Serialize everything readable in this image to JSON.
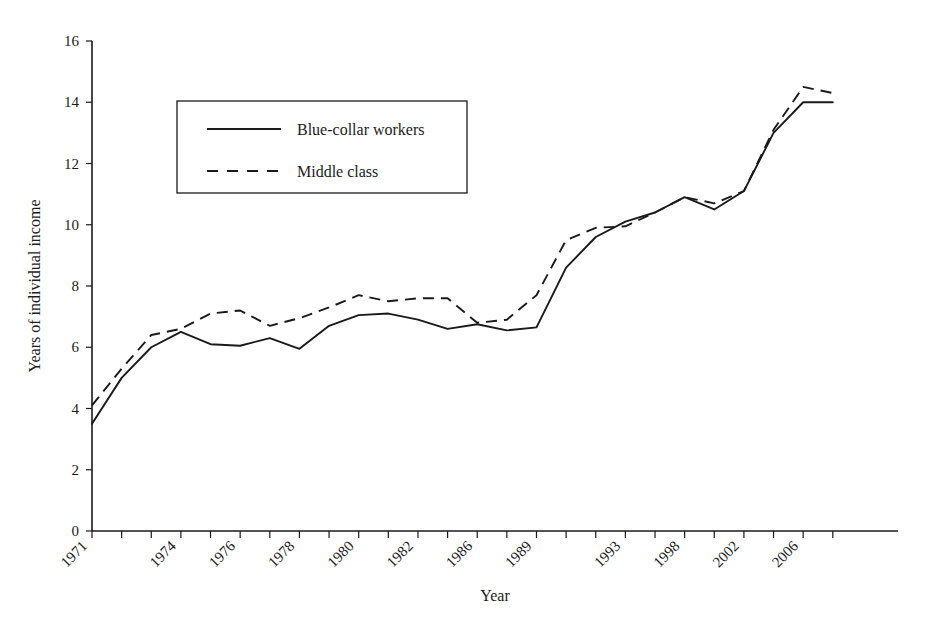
{
  "chart_data": {
    "type": "line",
    "title": "",
    "xlabel": "Year",
    "ylabel": "Years of individual income",
    "ylim": [
      0,
      16
    ],
    "ytick_values": [
      0,
      2,
      4,
      6,
      8,
      10,
      12,
      14,
      16
    ],
    "ytick_labels": [
      "0",
      "2",
      "4",
      "6",
      "8",
      "10",
      "12",
      "14",
      "16"
    ],
    "grid": false,
    "legend_position": "upper-left-inside",
    "x": [
      1971,
      1972,
      1973,
      1974,
      1975,
      1976,
      1977,
      1978,
      1979,
      1980,
      1981,
      1982,
      1984,
      1986,
      1987,
      1989,
      1991,
      1992,
      1993,
      1995,
      1998,
      2000,
      2002,
      2004,
      2006,
      2007
    ],
    "xtick_labels": [
      "1971",
      "",
      "",
      "1974",
      "",
      "1976",
      "",
      "1978",
      "",
      "1980",
      "",
      "1982",
      "",
      "1986",
      "",
      "1989",
      "",
      "",
      "1993",
      "",
      "1998",
      "",
      "2002",
      "",
      "2006",
      ""
    ],
    "series": [
      {
        "name": "Blue-collar workers",
        "style": "solid",
        "values": [
          3.5,
          5.0,
          6.0,
          6.5,
          6.1,
          6.05,
          6.3,
          5.95,
          6.7,
          7.05,
          7.1,
          6.9,
          6.6,
          6.75,
          6.55,
          6.65,
          8.6,
          9.6,
          10.1,
          10.4,
          10.9,
          10.5,
          11.1,
          13.0,
          14.0,
          14.0
        ]
      },
      {
        "name": "Middle class",
        "style": "dashed",
        "values": [
          4.1,
          5.3,
          6.4,
          6.6,
          7.1,
          7.2,
          6.7,
          6.95,
          7.3,
          7.7,
          7.5,
          7.6,
          7.6,
          6.8,
          6.9,
          7.7,
          9.5,
          9.9,
          9.95,
          10.4,
          10.9,
          10.7,
          11.1,
          13.1,
          14.5,
          14.3
        ]
      }
    ]
  },
  "legend": {
    "entries": [
      {
        "label": "Blue-collar workers",
        "style": "solid"
      },
      {
        "label": "Middle class",
        "style": "dashed"
      }
    ]
  },
  "axes": {
    "x_title": "Year",
    "y_title": "Years of individual income"
  }
}
